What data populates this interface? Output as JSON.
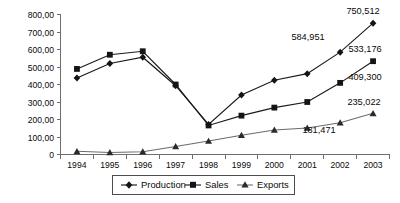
{
  "chart_data": {
    "type": "line",
    "title": "",
    "xlabel": "",
    "ylabel": "",
    "categories": [
      "1994",
      "1995",
      "1996",
      "1997",
      "1998",
      "1999",
      "2000",
      "2001",
      "2002",
      "2003"
    ],
    "ylim": [
      0,
      800000
    ],
    "ytick_labels": [
      "800,00",
      "700,00",
      "600,00",
      "500,00",
      "400,00",
      "300,00",
      "200,00",
      "100,00",
      "0"
    ],
    "ytick_values": [
      800000,
      700000,
      600000,
      500000,
      400000,
      300000,
      200000,
      100000,
      0
    ],
    "grid": false,
    "legend_position": "bottom",
    "series": [
      {
        "name": "Production",
        "marker": "diamond",
        "values": [
          437000,
          520000,
          556000,
          393000,
          172000,
          340000,
          424000,
          462000,
          584951,
          750512
        ]
      },
      {
        "name": "Sales",
        "marker": "square",
        "values": [
          489000,
          570000,
          590000,
          400000,
          166000,
          222000,
          268000,
          300000,
          409300,
          533176
        ]
      },
      {
        "name": "Exports",
        "marker": "triangle",
        "values": [
          18000,
          12000,
          16000,
          46000,
          77000,
          110000,
          140000,
          152000,
          181471,
          235022
        ]
      }
    ],
    "annotations": [
      {
        "text": "750,512",
        "series": "Production",
        "category": "2003"
      },
      {
        "text": "584,951",
        "series": "Production",
        "category": "2002"
      },
      {
        "text": "533,176",
        "series": "Sales",
        "category": "2003"
      },
      {
        "text": "409,300",
        "series": "Sales",
        "category": "2002"
      },
      {
        "text": "235,022",
        "series": "Exports",
        "category": "2003"
      },
      {
        "text": "181,471",
        "series": "Exports",
        "category": "2002"
      }
    ],
    "legend": [
      {
        "label": "Production",
        "marker": "diamond"
      },
      {
        "label": "Sales",
        "marker": "square"
      },
      {
        "label": "Exports",
        "marker": "triangle"
      }
    ]
  },
  "axis": {
    "y": {
      "t0": "800,00",
      "t1": "700,00",
      "t2": "600,00",
      "t3": "500,00",
      "t4": "400,00",
      "t5": "300,00",
      "t6": "200,00",
      "t7": "100,00",
      "t8": "0"
    },
    "x": {
      "t0": "1994",
      "t1": "1995",
      "t2": "1996",
      "t3": "1997",
      "t4": "1998",
      "t5": "1999",
      "t6": "2000",
      "t7": "2001",
      "t8": "2002",
      "t9": "2003"
    }
  },
  "labels": {
    "prod_2003": "750,512",
    "prod_2002": "584,951",
    "sales_2003": "533,176",
    "sales_2002": "409,300",
    "exp_2003": "235,022",
    "exp_2002": "181,471"
  },
  "legend": {
    "production": "Production",
    "sales": "Sales",
    "exports": "Exports"
  }
}
